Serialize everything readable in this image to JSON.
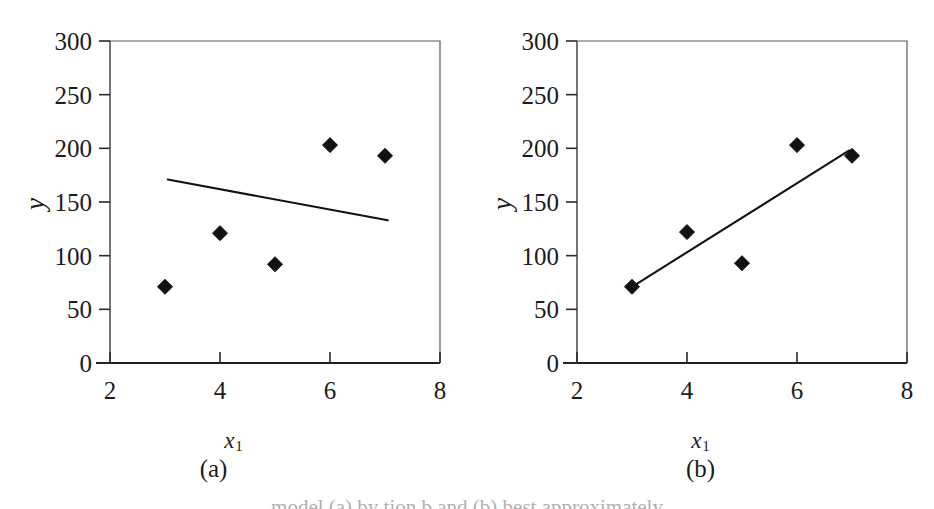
{
  "figure": {
    "background_color": "#ffffff",
    "ink_color": "#111111",
    "frame_color": "#5a5a5a",
    "bottom_caption": "model (a) by tion b and (b) best approximately"
  },
  "panels": [
    {
      "id": "a",
      "letter": "(a)",
      "xlabel_var": "x",
      "xlabel_sub": "1",
      "ylabel": "y"
    },
    {
      "id": "b",
      "letter": "(b)",
      "xlabel_var": "x",
      "xlabel_sub": "1",
      "ylabel": "y"
    }
  ],
  "chart_data": [
    {
      "type": "scatter",
      "panel": "(a)",
      "title": "",
      "xlabel": "x1",
      "ylabel": "y",
      "xlim": [
        2,
        8
      ],
      "ylim": [
        0,
        300
      ],
      "xticks": [
        2,
        4,
        6,
        8
      ],
      "yticks": [
        0,
        50,
        100,
        150,
        200,
        250,
        300
      ],
      "grid": false,
      "legend": "none",
      "series": [
        {
          "name": "observations",
          "marker": "filled-diamond",
          "x": [
            3,
            4,
            5,
            6,
            7
          ],
          "y": [
            71,
            121,
            92,
            203,
            193
          ]
        },
        {
          "name": "fitted-line",
          "type": "line",
          "x": [
            3.05,
            7.05
          ],
          "y": [
            171,
            133
          ],
          "slope": -9.5,
          "intercept": 200
        }
      ]
    },
    {
      "type": "scatter",
      "panel": "(b)",
      "title": "",
      "xlabel": "x1",
      "ylabel": "y",
      "xlim": [
        2,
        8
      ],
      "ylim": [
        0,
        300
      ],
      "xticks": [
        2,
        4,
        6,
        8
      ],
      "yticks": [
        0,
        50,
        100,
        150,
        200,
        250,
        300
      ],
      "grid": false,
      "legend": "none",
      "series": [
        {
          "name": "observations",
          "marker": "filled-diamond",
          "x": [
            3,
            4,
            5,
            6,
            7
          ],
          "y": [
            71,
            122,
            93,
            203,
            193
          ]
        },
        {
          "name": "fitted-line",
          "type": "line",
          "x": [
            3.0,
            6.95
          ],
          "y": [
            71,
            198
          ],
          "slope": 32.2,
          "intercept": -25.5
        }
      ]
    }
  ]
}
